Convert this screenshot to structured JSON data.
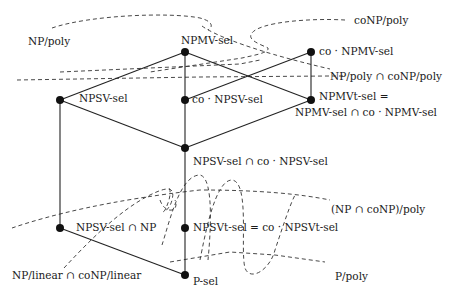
{
  "nodes": {
    "npmv_sel": "NPMV-sel",
    "co_npmv_sel": "co · NPMV-sel",
    "npsv_sel": "NPSV-sel",
    "co_npsv_sel": "co · NPSV-sel",
    "npmvt_sel_line1": "NPMVt-sel =",
    "npmvt_sel_line2": "NPMV-sel ∩ co · NPMV-sel",
    "npsv_cap_conpsv": "NPSV-sel ∩ co · NPSV-sel",
    "npsv_cap_np": "NPSV-sel ∩ NP",
    "npsvt_sel": "NPSVt-sel = co · NPSVt-sel",
    "p_sel": "P-sel"
  },
  "classes": {
    "np_poly": "NP/poly",
    "conp_poly": "coNP/poly",
    "np_poly_cap_conp_poly": "NP/poly ∩ coNP/poly",
    "np_cap_conp_poly": "(NP ∩ coNP)/poly",
    "np_linear_cap_conp_linear": "NP/linear ∩ coNP/linear",
    "p_poly": "P/poly"
  }
}
